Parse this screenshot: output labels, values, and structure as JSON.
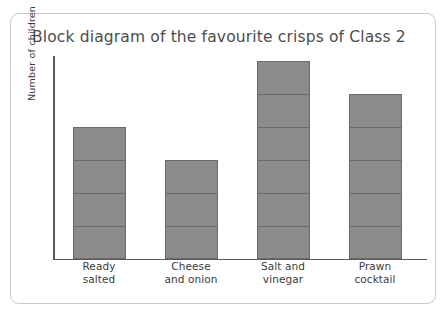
{
  "top_sliver_text": "",
  "card": {
    "title": "Block diagram of the favourite crisps of Class 2"
  },
  "chart_data": {
    "type": "bar",
    "title": "Block diagram of the favourite crisps of Class 2",
    "xlabel": "",
    "ylabel": "Number of children",
    "categories": [
      "Ready salted",
      "Cheese and onion",
      "Salt and vinegar",
      "Prawn cocktail"
    ],
    "category_lines": [
      [
        "Ready",
        "salted"
      ],
      [
        "Cheese",
        "and onion"
      ],
      [
        "Salt and",
        "vinegar"
      ],
      [
        "Prawn",
        "cocktail"
      ]
    ],
    "values": [
      4,
      3,
      6,
      5
    ],
    "ylim": [
      0,
      6
    ],
    "grid": false,
    "legend": false,
    "tick_labels_y": [],
    "block_style": "stacked unit blocks, 1 block = 1 child",
    "colors": {
      "bar_fill": "#8c8c8c",
      "bar_border": "#6b6b6b",
      "axis": "#5a5a5a",
      "text": "#3b3b3b",
      "title": "#4d4d4d",
      "card_border": "#c9c9c9",
      "background": "#ffffff"
    }
  }
}
